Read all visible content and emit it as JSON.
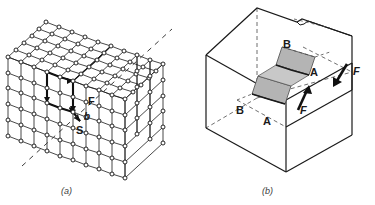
{
  "figure": {
    "panels": [
      {
        "caption": "(a)",
        "name": "crystal-lattice-burgers-circuit",
        "labels": [
          {
            "id": "finish",
            "text": "F",
            "x": 88,
            "y": 101
          },
          {
            "id": "burgers-vector",
            "text": "b",
            "x": 85,
            "y": 116
          },
          {
            "id": "start",
            "text": "S",
            "x": 78,
            "y": 130
          }
        ]
      },
      {
        "caption": "(b)",
        "name": "slip-block-diagram",
        "labels": [
          {
            "id": "plane-b-upper",
            "text": "B",
            "x": 287,
            "y": 44
          },
          {
            "id": "plane-a-upper",
            "text": "A",
            "x": 312,
            "y": 72
          },
          {
            "id": "plane-b-lower",
            "text": "B",
            "x": 239,
            "y": 110
          },
          {
            "id": "plane-a-lower",
            "text": "A",
            "x": 265,
            "y": 121
          },
          {
            "id": "force-inner",
            "text": "F",
            "x": 300,
            "y": 110
          },
          {
            "id": "force-outer",
            "text": "F",
            "x": 356,
            "y": 84
          }
        ]
      }
    ]
  },
  "colors": {
    "background": "#ffffff",
    "line": "#1a1a1a",
    "line_light": "#555555",
    "shade": "#b4b4b4",
    "caption": "#3b3b3b"
  }
}
